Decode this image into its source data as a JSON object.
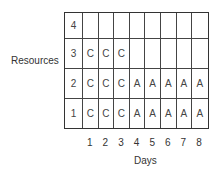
{
  "diagram": {
    "y_axis_label": "Resources",
    "x_axis_label": "Days",
    "days": [
      "1",
      "2",
      "3",
      "4",
      "5",
      "6",
      "7",
      "8"
    ],
    "rows": [
      {
        "resource": "4",
        "cells": [
          "",
          "",
          "",
          "",
          "",
          "",
          "",
          ""
        ]
      },
      {
        "resource": "3",
        "cells": [
          "C",
          "C",
          "C",
          "",
          "",
          "",
          "",
          ""
        ]
      },
      {
        "resource": "2",
        "cells": [
          "C",
          "C",
          "C",
          "A",
          "A",
          "A",
          "A",
          "A"
        ]
      },
      {
        "resource": "1",
        "cells": [
          "C",
          "C",
          "C",
          "A",
          "A",
          "A",
          "A",
          "A"
        ]
      }
    ]
  }
}
